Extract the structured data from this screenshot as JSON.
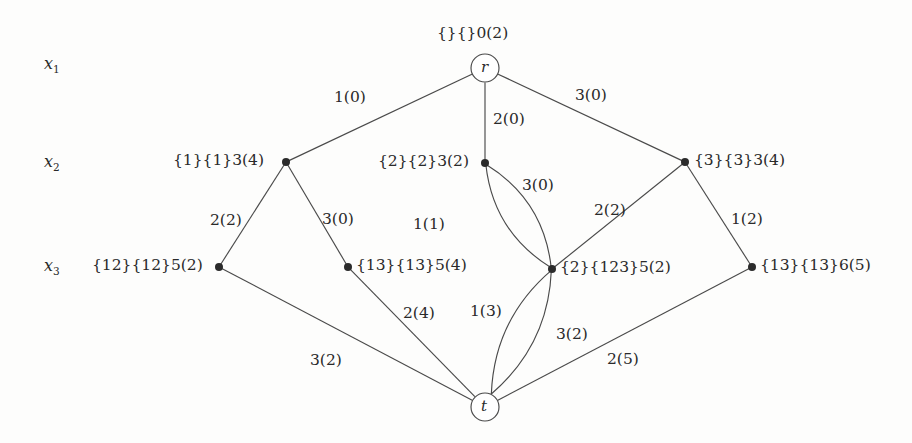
{
  "diagram": {
    "type": "layered-graph",
    "row_labels": [
      {
        "name": "x1",
        "base": "x",
        "sub": "1",
        "x": 44,
        "y": 56
      },
      {
        "name": "x2",
        "base": "x",
        "sub": "2",
        "x": 44,
        "y": 154
      },
      {
        "name": "x3",
        "base": "x",
        "sub": "3",
        "x": 44,
        "y": 258
      }
    ],
    "nodes": [
      {
        "id": "r",
        "shape": "circle",
        "name": "r",
        "cx": 485,
        "cy": 68,
        "r": 14,
        "label": "{}{}0(2)",
        "label_x": 437,
        "label_y": 26,
        "label_anchor": "left"
      },
      {
        "id": "a1",
        "shape": "dot",
        "name": "",
        "cx": 286,
        "cy": 162,
        "r": 4,
        "label": "{1}{1}3(4)",
        "label_x": 173,
        "label_y": 153,
        "label_anchor": "left"
      },
      {
        "id": "a2",
        "shape": "dot",
        "name": "",
        "cx": 485,
        "cy": 163,
        "r": 4,
        "label": "{2}{2}3(2)",
        "label_x": 378,
        "label_y": 154,
        "label_anchor": "left"
      },
      {
        "id": "a3",
        "shape": "dot",
        "name": "",
        "cx": 685,
        "cy": 162,
        "r": 4,
        "label": "{3}{3}3(4)",
        "label_x": 694,
        "label_y": 153,
        "label_anchor": "left"
      },
      {
        "id": "b1",
        "shape": "dot",
        "name": "",
        "cx": 219,
        "cy": 267,
        "r": 4,
        "label": "{12}{12}5(2)",
        "label_x": 92,
        "label_y": 258,
        "label_anchor": "left"
      },
      {
        "id": "b2",
        "shape": "dot",
        "name": "",
        "cx": 348,
        "cy": 267,
        "r": 4,
        "label": "{13}{13}5(4)",
        "label_x": 356,
        "label_y": 258,
        "label_anchor": "left"
      },
      {
        "id": "b3",
        "shape": "dot",
        "name": "",
        "cx": 552,
        "cy": 269,
        "r": 4,
        "label": "{2}{123}5(2)",
        "label_x": 560,
        "label_y": 260,
        "label_anchor": "left"
      },
      {
        "id": "b4",
        "shape": "dot",
        "name": "",
        "cx": 752,
        "cy": 267,
        "r": 4,
        "label": "{13}{13}6(5)",
        "label_x": 760,
        "label_y": 258,
        "label_anchor": "left"
      },
      {
        "id": "t",
        "shape": "circle",
        "name": "t",
        "cx": 485,
        "cy": 407,
        "r": 14,
        "label": "",
        "label_x": 0,
        "label_y": 0,
        "label_anchor": "left"
      }
    ],
    "edges": [
      {
        "from": "r",
        "to": "a1",
        "curve": "straight",
        "label": "1(0)",
        "label_x": 334,
        "label_y": 90
      },
      {
        "from": "r",
        "to": "a2",
        "curve": "straight",
        "label": "2(0)",
        "label_x": 493,
        "label_y": 112
      },
      {
        "from": "r",
        "to": "a3",
        "curve": "straight",
        "label": "3(0)",
        "label_x": 575,
        "label_y": 88
      },
      {
        "from": "a1",
        "to": "b1",
        "curve": "straight",
        "label": "2(2)",
        "label_x": 210,
        "label_y": 213
      },
      {
        "from": "a1",
        "to": "b2",
        "curve": "straight",
        "label": "3(0)",
        "label_x": 322,
        "label_y": 212
      },
      {
        "from": "a2",
        "to": "b3",
        "curve": "left",
        "label": "1(1)",
        "label_x": 413,
        "label_y": 217
      },
      {
        "from": "a2",
        "to": "b3",
        "curve": "right",
        "label": "3(0)",
        "label_x": 522,
        "label_y": 178
      },
      {
        "from": "a3",
        "to": "b3",
        "curve": "straight",
        "label": "2(2)",
        "label_x": 594,
        "label_y": 203
      },
      {
        "from": "a3",
        "to": "b4",
        "curve": "straight",
        "label": "1(2)",
        "label_x": 731,
        "label_y": 212
      },
      {
        "from": "b1",
        "to": "t",
        "curve": "straight",
        "label": "3(2)",
        "label_x": 310,
        "label_y": 353
      },
      {
        "from": "b2",
        "to": "t",
        "curve": "straight",
        "label": "2(4)",
        "label_x": 403,
        "label_y": 306
      },
      {
        "from": "b3",
        "to": "t",
        "curve": "left",
        "label": "1(3)",
        "label_x": 470,
        "label_y": 304
      },
      {
        "from": "b3",
        "to": "t",
        "curve": "right",
        "label": "3(2)",
        "label_x": 556,
        "label_y": 327
      },
      {
        "from": "b4",
        "to": "t",
        "curve": "straight",
        "label": "2(5)",
        "label_x": 607,
        "label_y": 352
      }
    ],
    "colors": {
      "stroke": "#4a4a4a",
      "node_fill": "#ffffff",
      "dot_fill": "#2b2b2b",
      "text": "#2a2a2a",
      "background": "#fdfdfc"
    }
  }
}
